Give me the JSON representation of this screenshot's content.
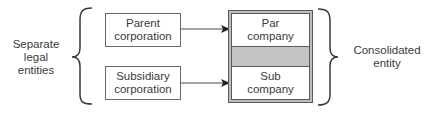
{
  "diagram": {
    "left_group_label": [
      "Separate",
      "legal",
      "entities"
    ],
    "right_group_label": [
      "Consolidated",
      "entity"
    ],
    "source_entities": [
      {
        "lines": [
          "Parent",
          "corporation"
        ]
      },
      {
        "lines": [
          "Subsidiary",
          "corporation"
        ]
      }
    ],
    "consolidated_parts": [
      {
        "lines": [
          "Par",
          "company"
        ]
      },
      {
        "lines": [
          "Sub",
          "company"
        ]
      }
    ],
    "connectors": [
      {
        "from": "Parent corporation",
        "to": "Par company"
      },
      {
        "from": "Subsidiary corporation",
        "to": "Sub company"
      }
    ],
    "colors": {
      "line": "#3a3a3a",
      "box_border": "#6a6a6a",
      "consolidated_fill": "#c4c4c4",
      "background": "#ffffff"
    }
  }
}
